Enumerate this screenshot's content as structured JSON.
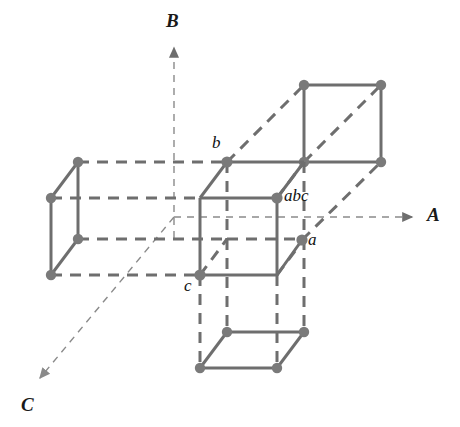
{
  "figure": {
    "type": "crystallographic-axes-diagram",
    "background_color": "#ffffff",
    "line_color": "#6e6e6e",
    "dash_color": "#6e6e6e",
    "axis_color": "#8a8a8a",
    "vertex_color": "#7a7a7a",
    "label_color": "#111111",
    "width": 460,
    "height": 427
  },
  "axes": [
    {
      "name": "axis-a",
      "label": "A",
      "direction": "right",
      "label_x": 428,
      "label_y": 206,
      "tip_x": 416,
      "tip_y": 217,
      "origin_x": 174,
      "origin_y": 217
    },
    {
      "name": "axis-b",
      "label": "B",
      "direction": "up",
      "label_x": 166,
      "label_y": 12,
      "tip_x": 174,
      "tip_y": 45,
      "origin_x": 174,
      "origin_y": 238
    },
    {
      "name": "axis-c",
      "label": "C",
      "direction": "down-left",
      "label_x": 22,
      "label_y": 396,
      "tip_x": 36,
      "tip_y": 382,
      "origin_x": 174,
      "origin_y": 217
    }
  ],
  "vertex_labels": [
    {
      "name": "label-b",
      "text": "b",
      "x": 214,
      "y": 137,
      "vertex_x": 227,
      "vertex_y": 162
    },
    {
      "name": "label-abc",
      "text": "abc",
      "x": 285,
      "y": 188,
      "vertex_x": 277,
      "vertex_y": 198
    },
    {
      "name": "label-a",
      "text": "a",
      "x": 309,
      "y": 233,
      "vertex_x": 302,
      "vertex_y": 240
    },
    {
      "name": "label-c",
      "text": "c",
      "x": 186,
      "y": 280,
      "vertex_x": 200,
      "vertex_y": 275
    }
  ],
  "cells": [
    {
      "name": "central-cell",
      "description": "origin unit cell, fully drawn, vertices labelled a b c abc"
    },
    {
      "name": "left-cell",
      "description": "neighbouring cell translated along -A, only left face drawn solid"
    },
    {
      "name": "upper-right-cell",
      "description": "neighbouring cell translated along +A and +B, front face drawn solid"
    },
    {
      "name": "lower-cell",
      "description": "neighbouring cell translated along -B, bottom face drawn solid"
    }
  ],
  "geometry": {
    "front_left_bottom": [
      200,
      275
    ],
    "front_right_bottom": [
      277,
      275
    ],
    "front_left_top": [
      200,
      198
    ],
    "front_right_top": [
      277,
      198
    ],
    "depth_dx": 27,
    "depth_dy": -36,
    "cell_size": 77,
    "vertex_radius": 5.2,
    "solid_stroke": 3,
    "dash_stroke": 3,
    "axis_stroke": 1.4
  }
}
